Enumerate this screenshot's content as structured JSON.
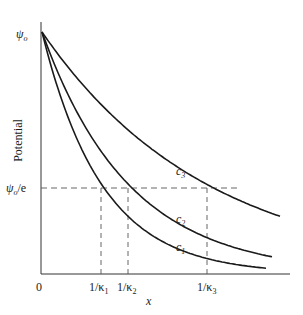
{
  "chart_data": {
    "type": "line",
    "title": "",
    "xlabel": "x",
    "ylabel": "Potential",
    "y_ticks": [
      {
        "label": "ψo",
        "value": 1.0
      },
      {
        "label": "ψo/e",
        "value": 0.3679
      }
    ],
    "x_ticks": [
      {
        "label": "0",
        "value": 0
      },
      {
        "label": "1/κ1",
        "value": 60
      },
      {
        "label": "1/κ2",
        "value": 87
      },
      {
        "label": "1/κ3",
        "value": 166
      }
    ],
    "series": [
      {
        "name": "c1",
        "decay_length": 60,
        "x_end": 224
      },
      {
        "name": "c2",
        "decay_length": 87,
        "x_end": 231
      },
      {
        "name": "c3",
        "decay_length": 166,
        "x_end": 239
      }
    ],
    "xlim": [
      0,
      249
    ],
    "ylim": [
      0,
      1
    ],
    "grid": false,
    "legend": "inline curve labels"
  },
  "labels": {
    "ylabel": "Potential",
    "xlabel": "x",
    "origin": "0",
    "psi0": "ψ",
    "psi0_sub": "o",
    "psi0e": "ψ",
    "psi0e_sub": "o",
    "psi0e_tail": "/e",
    "k1": "1/κ",
    "k1_sub": "1",
    "k2": "1/κ",
    "k2_sub": "2",
    "k3": "1/κ",
    "k3_sub": "3",
    "c1": "c",
    "c1_sub": "1",
    "c2": "c",
    "c2_sub": "2",
    "c3": "c",
    "c3_sub": "3"
  }
}
